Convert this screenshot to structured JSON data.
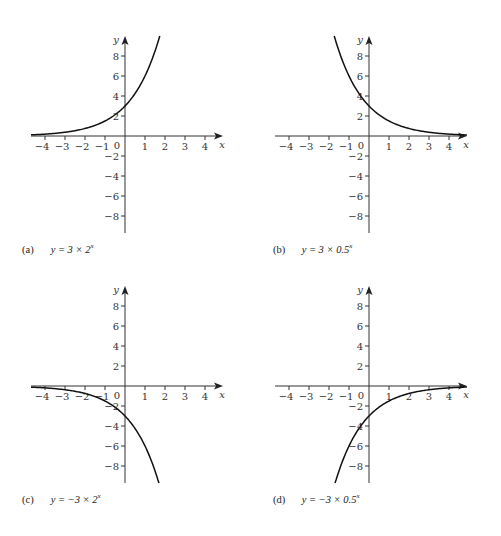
{
  "panels": [
    {
      "id": "a",
      "tag": "(a)",
      "eq_prefix": "y = 3 × 2",
      "eq_exp": "x",
      "a": 3,
      "b": 2,
      "ox": 125,
      "oy": 136
    },
    {
      "id": "b",
      "tag": "(b)",
      "eq_prefix": "y = 3 × 0.5",
      "eq_exp": "x",
      "a": 3,
      "b": 0.5,
      "ox": 369,
      "oy": 136
    },
    {
      "id": "c",
      "tag": "(c)",
      "eq_prefix": "y = −3 × 2",
      "eq_exp": "x",
      "a": -3,
      "b": 2,
      "ox": 125,
      "oy": 386
    },
    {
      "id": "d",
      "tag": "(d)",
      "eq_prefix": "y = −3 × 0.5",
      "eq_exp": "x",
      "a": -3,
      "b": 0.5,
      "ox": 369,
      "oy": 386
    }
  ],
  "axes": {
    "x_label": "x",
    "y_label": "y",
    "origin_label": "0",
    "x_ticks": [
      -4,
      -3,
      -2,
      -1,
      1,
      2,
      3,
      4
    ],
    "y_ticks": [
      8,
      6,
      4,
      2,
      -2,
      -4,
      -6,
      -8
    ],
    "x_range": [
      -4.7,
      4.9
    ],
    "y_range": [
      -9.7,
      10.0
    ]
  },
  "chart_data": [
    {
      "type": "line",
      "title": "(a) y = 3 × 2^x",
      "xlabel": "x",
      "ylabel": "y",
      "xlim": [
        -4.7,
        4.9
      ],
      "ylim": [
        -9.7,
        10
      ],
      "x_ticks": [
        -4,
        -3,
        -2,
        -1,
        0,
        1,
        2,
        3,
        4
      ],
      "y_ticks": [
        -8,
        -6,
        -4,
        -2,
        2,
        4,
        6,
        8
      ],
      "grid": false,
      "series": [
        {
          "name": "y = 3 × 2^x",
          "x": [
            -4.7,
            -4,
            -3,
            -2,
            -1,
            0,
            1,
            1.5,
            1.74
          ],
          "y": [
            0.12,
            0.19,
            0.375,
            0.75,
            1.5,
            3,
            6,
            8.49,
            10
          ]
        }
      ]
    },
    {
      "type": "line",
      "title": "(b) y = 3 × 0.5^x",
      "xlabel": "x",
      "ylabel": "y",
      "xlim": [
        -4.7,
        4.9
      ],
      "ylim": [
        -9.7,
        10
      ],
      "x_ticks": [
        -4,
        -3,
        -2,
        -1,
        0,
        1,
        2,
        3,
        4
      ],
      "y_ticks": [
        -8,
        -6,
        -4,
        -2,
        2,
        4,
        6,
        8
      ],
      "grid": false,
      "series": [
        {
          "name": "y = 3 × 0.5^x",
          "x": [
            -1.74,
            -1.5,
            -1,
            0,
            1,
            2,
            3,
            4,
            4.9
          ],
          "y": [
            10,
            8.49,
            6,
            3,
            1.5,
            0.75,
            0.375,
            0.19,
            0.1
          ]
        }
      ]
    },
    {
      "type": "line",
      "title": "(c) y = −3 × 2^x",
      "xlabel": "x",
      "ylabel": "y",
      "xlim": [
        -4.7,
        4.9
      ],
      "ylim": [
        -9.7,
        10
      ],
      "x_ticks": [
        -4,
        -3,
        -2,
        -1,
        0,
        1,
        2,
        3,
        4
      ],
      "y_ticks": [
        -8,
        -6,
        -4,
        -2,
        2,
        4,
        6,
        8
      ],
      "grid": false,
      "series": [
        {
          "name": "y = −3 × 2^x",
          "x": [
            -4.7,
            -4,
            -3,
            -2,
            -1,
            0,
            1,
            1.5,
            1.7
          ],
          "y": [
            -0.12,
            -0.19,
            -0.375,
            -0.75,
            -1.5,
            -3,
            -6,
            -8.49,
            -9.75
          ]
        }
      ]
    },
    {
      "type": "line",
      "title": "(d) y = −3 × 0.5^x",
      "xlabel": "x",
      "ylabel": "y",
      "xlim": [
        -4.7,
        4.9
      ],
      "ylim": [
        -9.7,
        10
      ],
      "x_ticks": [
        -4,
        -3,
        -2,
        -1,
        0,
        1,
        2,
        3,
        4
      ],
      "y_ticks": [
        -8,
        -6,
        -4,
        -2,
        2,
        4,
        6,
        8
      ],
      "grid": false,
      "series": [
        {
          "name": "y = −3 × 0.5^x",
          "x": [
            -1.7,
            -1.5,
            -1,
            0,
            1,
            2,
            3,
            4,
            4.9
          ],
          "y": [
            -9.75,
            -8.49,
            -6,
            -3,
            -1.5,
            -0.75,
            -0.375,
            -0.19,
            -0.1
          ]
        }
      ]
    }
  ]
}
